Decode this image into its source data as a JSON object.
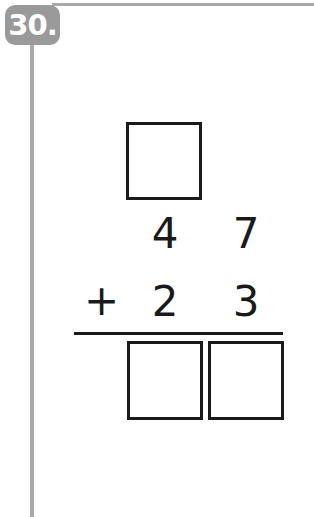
{
  "problem": {
    "number_label": "30.",
    "carry_box_value": "",
    "addend_top": {
      "tens": "4",
      "ones": "7"
    },
    "operator": "+",
    "addend_bottom": {
      "tens": "2",
      "ones": "3"
    },
    "answer": {
      "tens": "",
      "ones": ""
    }
  },
  "colors": {
    "frame": "#a8a8a8",
    "badge": "#9a9a9a",
    "ink": "#1a1a1a"
  }
}
